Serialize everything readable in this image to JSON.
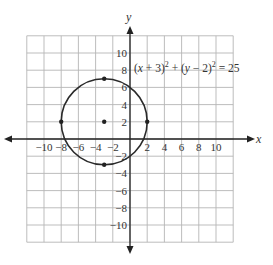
{
  "chart_data": {
    "type": "scatter",
    "title": "",
    "xlabel": "x",
    "ylabel": "y",
    "xlim": [
      -12,
      12
    ],
    "ylim": [
      -12,
      12
    ],
    "grid": true,
    "grid_step": 2,
    "x_ticks": [
      -10,
      -8,
      -6,
      -4,
      -2,
      2,
      4,
      6,
      8,
      10
    ],
    "y_ticks": [
      10,
      8,
      6,
      4,
      2,
      -2,
      -4,
      -6,
      -8,
      -10
    ],
    "x_tick_labels": [
      "−10",
      "−8",
      "−6",
      "−4",
      "−2",
      "2",
      "4",
      "6",
      "8",
      "10"
    ],
    "y_tick_labels": [
      "10",
      "8",
      "6",
      "4",
      "2",
      "−2",
      "−4",
      "−6",
      "−8",
      "−10"
    ],
    "circle": {
      "center": [
        -3,
        2
      ],
      "radius": 5
    },
    "points": [
      {
        "x": -3,
        "y": 2,
        "role": "center"
      },
      {
        "x": -3,
        "y": 7,
        "role": "top"
      },
      {
        "x": -3,
        "y": -3,
        "role": "bottom"
      },
      {
        "x": -8,
        "y": 2,
        "role": "left"
      },
      {
        "x": 2,
        "y": 2,
        "role": "right"
      }
    ],
    "annotation": {
      "text": "(x + 3)² + (y − 2)² = 25",
      "x": 0.5,
      "y": 8.3
    }
  },
  "labels": {
    "x_axis": "x",
    "y_axis": "y",
    "equation_parts": [
      "(",
      "x",
      " + 3)",
      "2",
      " + (",
      "y",
      " − 2)",
      "2",
      " = 25"
    ]
  }
}
